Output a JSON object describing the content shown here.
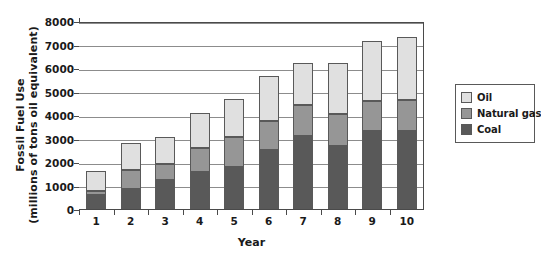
{
  "chart_data": {
    "type": "bar",
    "subtype": "stacked-vertical",
    "title": "",
    "xlabel": "Year",
    "ylabel": "Fossil Fuel Use (millions of tons oil equivalent)",
    "ylabel_lines": [
      "Fossil Fuel Use",
      "(millions of tons oil equivalent)"
    ],
    "categories": [
      "1",
      "2",
      "3",
      "4",
      "5",
      "6",
      "7",
      "8",
      "9",
      "10"
    ],
    "ylim": [
      0,
      8000
    ],
    "yticks": [
      0,
      1000,
      2000,
      3000,
      4000,
      5000,
      6000,
      7000,
      8000
    ],
    "ytick_labels": [
      "0",
      "1000",
      "2000",
      "3000",
      "4000",
      "5000",
      "6000",
      "7000",
      "8000"
    ],
    "grid": true,
    "grid_axis": "y",
    "legend_position": "right",
    "stack_order_bottom_to_top": [
      "Coal",
      "Natural gas",
      "Oil"
    ],
    "series": [
      {
        "name": "Coal",
        "color": "#595959",
        "values": [
          600,
          850,
          1250,
          1570,
          1800,
          2500,
          3100,
          2660,
          3300,
          3300
        ]
      },
      {
        "name": "Natural gas",
        "color": "#969696",
        "values": [
          150,
          800,
          650,
          1030,
          1250,
          1250,
          1320,
          1370,
          1310,
          1320
        ]
      },
      {
        "name": "Oil",
        "color": "#e0e0e0",
        "values": [
          850,
          1170,
          1180,
          1500,
          1650,
          1900,
          1810,
          2200,
          2560,
          2680
        ]
      }
    ],
    "cumulative_tops": {
      "coal": [
        600,
        850,
        1250,
        1570,
        1800,
        2500,
        3100,
        2660,
        3300,
        3300
      ],
      "natural_gas": [
        750,
        1650,
        1900,
        2600,
        3050,
        3750,
        4420,
        4030,
        4610,
        4620
      ],
      "total": [
        1600,
        2820,
        3080,
        4100,
        4700,
        5650,
        6230,
        6230,
        7170,
        7300
      ]
    }
  },
  "legend": {
    "items": [
      {
        "label": "Oil",
        "color": "#e0e0e0"
      },
      {
        "label": "Natural gas",
        "color": "#969696"
      },
      {
        "label": "Coal",
        "color": "#595959"
      }
    ]
  },
  "colors": {
    "oil": "#e0e0e0",
    "natural_gas": "#969696",
    "coal": "#595959",
    "grid": "#8c8c8c",
    "axis": "#4a4a4a",
    "bar_border": "#595959",
    "background": "#ffffff"
  }
}
